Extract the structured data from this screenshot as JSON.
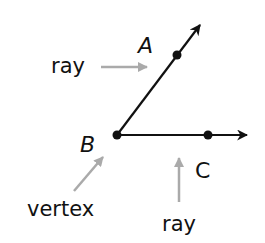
{
  "diagram": {
    "points": {
      "A": {
        "label": "A"
      },
      "B": {
        "label": "B"
      },
      "C": {
        "label": "C"
      }
    },
    "annotations": {
      "ray_top": "ray",
      "vertex": "vertex",
      "ray_bottom": "ray"
    },
    "colors": {
      "line": "#111111",
      "pointer_arrow": "#aaaaaa",
      "background": "#ffffff"
    }
  }
}
